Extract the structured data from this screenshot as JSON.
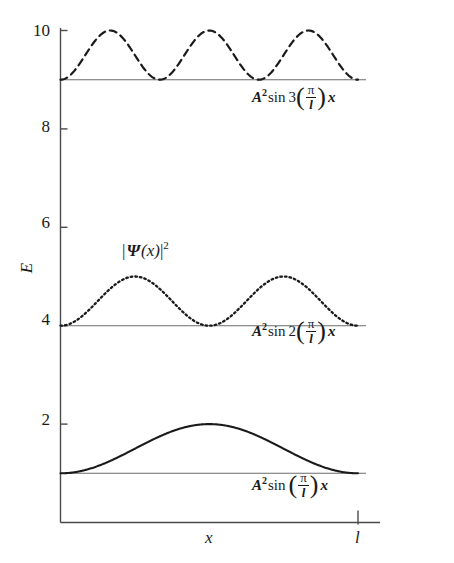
{
  "chart_data": {
    "type": "line",
    "title": "",
    "xlabel": "x",
    "ylabel": "E",
    "xlim": [
      0,
      1
    ],
    "ylim": [
      0,
      10.6
    ],
    "grid": false,
    "legend_position": "inline-right",
    "x_ticks": [
      {
        "value": 1,
        "label": "l"
      }
    ],
    "y_ticks": [
      {
        "value": 2,
        "label": "2"
      },
      {
        "value": 4,
        "label": "4"
      },
      {
        "value": 6,
        "label": "6"
      },
      {
        "value": 8,
        "label": "8"
      },
      {
        "value": 10,
        "label": "10"
      }
    ],
    "annotations": [
      {
        "id": "psi-squared",
        "text": "|Ψ(x)|²",
        "x": 0.3,
        "y": 5.6
      }
    ],
    "series": [
      {
        "name": "n1",
        "quantum_number": 1,
        "style": "solid",
        "baseline": 1,
        "amplitude": 1,
        "peak": 2,
        "humps": 1,
        "color": "#1a1a1a",
        "label_plain": "A² sin (π/l)x",
        "label_parts": {
          "amplitude": "A",
          "amplitude_exponent": "2",
          "function": "sin",
          "coefficient": "",
          "numerator": "π",
          "denominator": "l",
          "variable": "x"
        }
      },
      {
        "name": "n2",
        "quantum_number": 2,
        "style": "dotted",
        "baseline": 4,
        "amplitude": 1,
        "peak": 5,
        "humps": 2,
        "color": "#1a1a1a",
        "label_plain": "A² sin 2(π/l)x",
        "label_parts": {
          "amplitude": "A",
          "amplitude_exponent": "2",
          "function": "sin",
          "coefficient": "2",
          "numerator": "π",
          "denominator": "l",
          "variable": "x"
        }
      },
      {
        "name": "n3",
        "quantum_number": 3,
        "style": "dashed",
        "baseline": 9,
        "amplitude": 1,
        "peak": 10,
        "humps": 3,
        "color": "#1a1a1a",
        "label_plain": "A² sin 3(π/l)x",
        "label_parts": {
          "amplitude": "A",
          "amplitude_exponent": "2",
          "function": "sin",
          "coefficient": "3",
          "numerator": "π",
          "denominator": "l",
          "variable": "x"
        }
      }
    ]
  }
}
